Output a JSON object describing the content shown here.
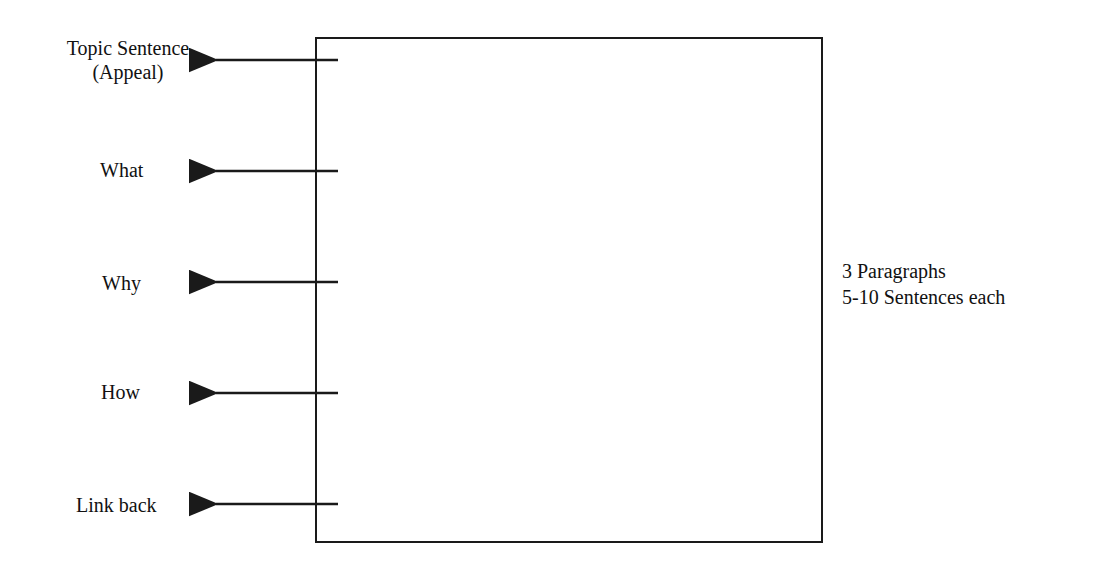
{
  "diagram": {
    "labels": [
      {
        "line1": "Topic Sentence",
        "line2": "(Appeal)"
      },
      {
        "line1": "What"
      },
      {
        "line1": "Why"
      },
      {
        "line1": "How"
      },
      {
        "line1": "Link back"
      }
    ],
    "side_note": {
      "line1": "3 Paragraphs",
      "line2": "5-10 Sentences each"
    },
    "colors": {
      "stroke": "#1a1a1a",
      "background": "#ffffff"
    }
  }
}
